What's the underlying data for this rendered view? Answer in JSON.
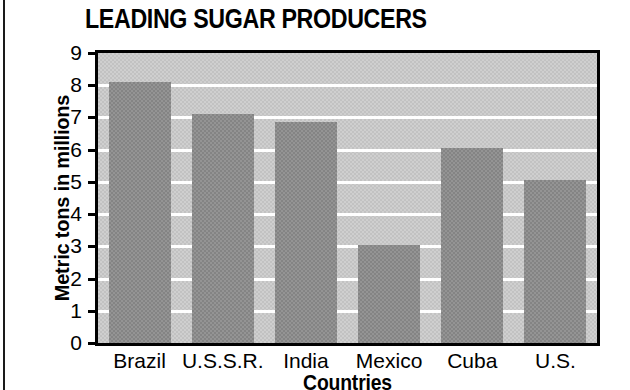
{
  "chart_data": {
    "type": "bar",
    "title": "LEADING SUGAR PRODUCERS",
    "xlabel": "Countries",
    "ylabel": "Metric tons in millions",
    "categories": [
      "Brazil",
      "U.S.S.R.",
      "India",
      "Mexico",
      "Cuba",
      "U.S."
    ],
    "values": [
      8.1,
      7.1,
      6.85,
      3.05,
      6.05,
      5.05
    ],
    "ylim": [
      0,
      9
    ],
    "ytick_labels": [
      "9",
      "8",
      "7",
      "6",
      "5",
      "4",
      "3",
      "2",
      "1",
      "0"
    ],
    "ytick_values": [
      9,
      8,
      7,
      6,
      5,
      4,
      3,
      2,
      1,
      0
    ],
    "grid": true,
    "gridline_color": "#ffffff",
    "legend": null,
    "bar_color": "#8d8d8d",
    "plot_background_color": "#c9c9c9",
    "axis_color": "#000000",
    "units": "millions of metric tons"
  }
}
